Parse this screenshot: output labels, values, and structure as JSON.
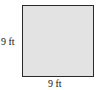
{
  "figure": {
    "shape": "square",
    "fill_color": "#e3e3e3",
    "stroke_color": "#2a2a2a",
    "side_label": "9 ft",
    "bottom_label": "9 ft"
  }
}
